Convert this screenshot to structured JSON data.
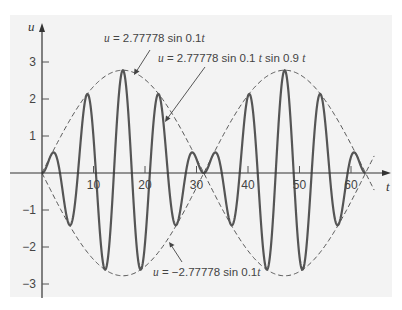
{
  "chart_data": {
    "type": "line",
    "title": "",
    "xlabel": "t",
    "ylabel": "u",
    "xlim": [
      0,
      66
    ],
    "ylim": [
      -3.2,
      3.4
    ],
    "grid": false,
    "legend": "none (inline annotations)",
    "x_ticks": [
      10,
      20,
      30,
      40,
      50,
      60
    ],
    "y_ticks": [
      -3,
      -2,
      -1,
      1,
      2,
      3
    ],
    "x_tick_labels": [
      "10",
      "20",
      "30",
      "40",
      "50",
      "60"
    ],
    "y_tick_labels": [
      "−3",
      "−2",
      "−1",
      "1",
      "2",
      "3"
    ],
    "series": [
      {
        "name": "u = 2.77778 sin 0.1 t sin 0.9 t",
        "style": "solid",
        "formula": {
          "amplitude": 2.77778,
          "envelope_freq": 0.1,
          "carrier_freq": 0.9
        },
        "t_range": [
          0,
          62.83
        ],
        "key_points": [
          {
            "t": 0,
            "u": 0
          },
          {
            "t": 1.7,
            "u": 0.47
          },
          {
            "t": 5.2,
            "u": -1.33
          },
          {
            "t": 8.7,
            "u": 2.12
          },
          {
            "t": 12.2,
            "u": -2.6
          },
          {
            "t": 15.7,
            "u": 2.78
          },
          {
            "t": 19.2,
            "u": -2.6
          },
          {
            "t": 22.7,
            "u": 2.12
          },
          {
            "t": 26.2,
            "u": -1.33
          },
          {
            "t": 29.7,
            "u": 0.47
          },
          {
            "t": 31.4,
            "u": 0
          },
          {
            "t": 33.2,
            "u": 0.47
          },
          {
            "t": 36.7,
            "u": -1.33
          },
          {
            "t": 40.2,
            "u": 2.12
          },
          {
            "t": 43.7,
            "u": -2.6
          },
          {
            "t": 47.1,
            "u": 2.78
          },
          {
            "t": 50.6,
            "u": -2.6
          },
          {
            "t": 54.1,
            "u": 2.12
          },
          {
            "t": 57.6,
            "u": -1.33
          },
          {
            "t": 61.1,
            "u": 0.47
          },
          {
            "t": 62.8,
            "u": 0
          }
        ]
      },
      {
        "name": "u = 2.77778 sin 0.1t",
        "style": "dashed",
        "formula": {
          "amplitude": 2.77778,
          "freq": 0.1
        },
        "t_range": [
          0,
          64.5
        ],
        "key_points": [
          {
            "t": 0,
            "u": 0
          },
          {
            "t": 15.7,
            "u": 2.78
          },
          {
            "t": 31.4,
            "u": 0
          },
          {
            "t": 47.1,
            "u": -2.78
          },
          {
            "t": 62.8,
            "u": 0
          }
        ]
      },
      {
        "name": "u = −2.77778 sin 0.1t",
        "style": "dashed",
        "formula": {
          "amplitude": -2.77778,
          "freq": 0.1
        },
        "t_range": [
          0,
          64.5
        ],
        "key_points": [
          {
            "t": 0,
            "u": 0
          },
          {
            "t": 15.7,
            "u": -2.78
          },
          {
            "t": 31.4,
            "u": 0
          },
          {
            "t": 47.1,
            "u": 2.78
          },
          {
            "t": 62.8,
            "u": 0
          }
        ]
      }
    ],
    "annotations": [
      {
        "text_prefix": "u",
        "text_body": " = 2.77778 sin 0.1",
        "text_var": "t",
        "text_tail": "",
        "points_to": "upper envelope near t≈18"
      },
      {
        "text_prefix": "u",
        "text_body": " = 2.77778 sin 0.1 ",
        "text_var": "t",
        "text_tail": " sin 0.9 ",
        "text_var2": "t",
        "points_to": "solid curve near t≈24"
      },
      {
        "text_prefix": "u",
        "text_body": " = −2.77778 sin 0.1",
        "text_var": "t",
        "text_tail": "",
        "points_to": "lower envelope near t≈25"
      }
    ]
  },
  "plot": {
    "origin_px": [
      42,
      173
    ],
    "px_per_t": 5.15,
    "px_per_u": 37,
    "colors": {
      "panel": "#f3f3f3",
      "background": "#ffffff",
      "curve": "#555555",
      "axis": "#333333",
      "text": "#444444"
    }
  }
}
